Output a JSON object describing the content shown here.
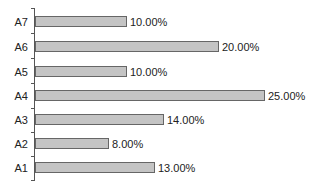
{
  "chart_data": {
    "type": "bar",
    "orientation": "horizontal",
    "title": "",
    "xlabel": "",
    "ylabel": "",
    "categories": [
      "A7",
      "A6",
      "A5",
      "A4",
      "A3",
      "A2",
      "A1"
    ],
    "values": [
      10.0,
      20.0,
      10.0,
      25.0,
      14.0,
      8.0,
      13.0
    ],
    "labels": [
      "10.00%",
      "20.00%",
      "10.00%",
      "25.00%",
      "14.00%",
      "8.00%",
      "13.00%"
    ],
    "unit": "%",
    "xlim": [
      0,
      25
    ],
    "grid": false,
    "legend": null,
    "bar_color": "#c4c4c4",
    "bar_border_color": "#666666"
  }
}
